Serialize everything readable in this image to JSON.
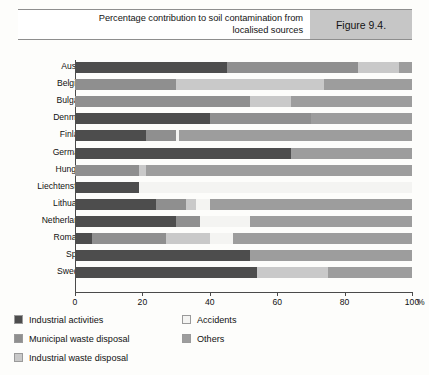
{
  "header": {
    "title": "Percentage contribution to soil contamination from\nlocalised sources",
    "figure_label": "Figure 9.4."
  },
  "colors": {
    "industrial_activities": "#4d4d4d",
    "municipal_waste_disposal": "#8f8f8f",
    "industrial_waste_disposal": "#c9c9c9",
    "accidents": "#f4f4f2",
    "others": "#9d9d9d",
    "axis": "#4a4a4a",
    "figure_cell_bg": "#c6c6c6"
  },
  "axis": {
    "unit": "%",
    "ticks": [
      0,
      20,
      40,
      60,
      80,
      100
    ],
    "tick_labels": [
      "0",
      "20",
      "40",
      "60",
      "80",
      "100"
    ],
    "min": 0,
    "max": 100
  },
  "legend": {
    "left_column": [
      {
        "label": "Industrial activities",
        "key": "industrial_activities"
      },
      {
        "label": "Municipal waste disposal",
        "key": "municipal_waste_disposal"
      },
      {
        "label": "Industrial waste disposal",
        "key": "industrial_waste_disposal"
      }
    ],
    "right_column": [
      {
        "label": "Accidents",
        "key": "accidents"
      },
      {
        "label": "Others",
        "key": "others"
      }
    ]
  },
  "chart_data": {
    "type": "bar",
    "orientation": "horizontal",
    "stacked": true,
    "stack_total": 100,
    "title": "Percentage contribution to soil contamination from localised sources",
    "xlabel": "%",
    "ylabel": "",
    "xlim": [
      0,
      100
    ],
    "grid": false,
    "legend_position": "bottom-left",
    "categories": [
      "Austria",
      "Belgium",
      "Bulgaria",
      "Denmark",
      "Finland",
      "Germany",
      "Hungary",
      "Liechtenstein",
      "Lithuania",
      "Netherlands",
      "Romania",
      "Spain",
      "Sweden"
    ],
    "series": [
      {
        "name": "Industrial activities",
        "color": "#4d4d4d",
        "values": [
          45,
          0,
          0,
          40,
          21,
          64,
          0,
          19,
          24,
          30,
          5,
          52,
          54
        ]
      },
      {
        "name": "Municipal waste disposal",
        "color": "#8f8f8f",
        "values": [
          39,
          30,
          52,
          30,
          9,
          0,
          19,
          0,
          9,
          7,
          22,
          0,
          0
        ]
      },
      {
        "name": "Industrial waste disposal",
        "color": "#c9c9c9",
        "values": [
          12,
          44,
          12,
          0,
          0,
          0,
          2,
          0,
          3,
          0,
          13,
          0,
          21
        ]
      },
      {
        "name": "Accidents",
        "color": "#f4f4f2",
        "values": [
          0,
          0,
          0,
          0,
          1,
          0,
          0,
          81,
          4,
          15,
          7,
          0,
          0
        ]
      },
      {
        "name": "Others",
        "color": "#9d9d9d",
        "values": [
          4,
          26,
          36,
          30,
          69,
          36,
          79,
          0,
          60,
          48,
          53,
          48,
          25
        ]
      }
    ]
  }
}
